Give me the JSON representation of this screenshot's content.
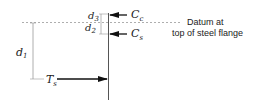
{
  "diagram": {
    "labels": {
      "d1": "d",
      "d1_sub": "1",
      "d2": "d",
      "d2_sub": "2",
      "d3": "d",
      "d3_sub": "3",
      "Cc": "C",
      "Cc_sub": "c",
      "Cs": "C",
      "Cs_sub": "s",
      "Ts": "T",
      "Ts_sub": "s"
    },
    "datum_label": {
      "line1": "Datum at",
      "line2": "top of steel flange"
    },
    "colors": {
      "line": "#555555",
      "dashed": "#999999",
      "arrow": "#111111"
    }
  }
}
